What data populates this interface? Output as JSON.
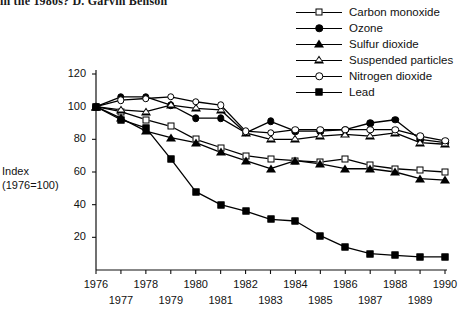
{
  "running_head": "in the 1980s?   D. Garvin Benson",
  "chart_data": {
    "type": "line",
    "title": "",
    "xlabel": "",
    "ylabel": "Index (1976=100)",
    "ylabel_lines": [
      "Index",
      "(1976=100)"
    ],
    "x": [
      1976,
      1977,
      1978,
      1979,
      1980,
      1981,
      1982,
      1983,
      1984,
      1985,
      1986,
      1987,
      1988,
      1989,
      1990
    ],
    "xlim": [
      1976,
      1990
    ],
    "ylim": [
      0,
      120
    ],
    "yticks": [
      0,
      20,
      40,
      60,
      80,
      100,
      120
    ],
    "ytick_labels": [
      "0",
      "20",
      "40",
      "60",
      "80",
      "100",
      "120"
    ],
    "xticks": [
      1976,
      1977,
      1978,
      1979,
      1980,
      1981,
      1982,
      1983,
      1984,
      1985,
      1986,
      1987,
      1988,
      1989,
      1990
    ],
    "xtick_labels_upper": [
      "1976",
      "1978",
      "1980",
      "1982",
      "1984",
      "1986",
      "1988",
      "1990"
    ],
    "xtick_labels_lower": [
      "1977",
      "1979",
      "1981",
      "1983",
      "1985",
      "1987",
      "1989"
    ],
    "grid": false,
    "legend_position": "top-right",
    "series": [
      {
        "name": "Carbon monoxide",
        "marker": "square-open",
        "values": [
          100,
          97,
          92,
          88,
          80,
          75,
          70,
          68,
          67,
          66,
          68,
          64,
          62,
          61,
          60
        ]
      },
      {
        "name": "Ozone",
        "marker": "circle-filled",
        "values": [
          100,
          106,
          106,
          101,
          93,
          93,
          84,
          91,
          85,
          85,
          86,
          90,
          92,
          80,
          78
        ]
      },
      {
        "name": "Sulfur dioxide",
        "marker": "triangle-filled",
        "values": [
          100,
          93,
          85,
          81,
          78,
          72,
          67,
          62,
          67,
          65,
          62,
          62,
          60,
          56,
          55
        ]
      },
      {
        "name": "Suspended particles",
        "marker": "triangle-open",
        "values": [
          100,
          98,
          97,
          101,
          99,
          98,
          84,
          80,
          80,
          82,
          83,
          82,
          84,
          78,
          77
        ]
      },
      {
        "name": "Nitrogen dioxide",
        "marker": "circle-open",
        "values": [
          100,
          104,
          105,
          106,
          103,
          101,
          85,
          84,
          86,
          86,
          86,
          86,
          86,
          82,
          79
        ]
      },
      {
        "name": "Lead",
        "marker": "square-filled",
        "values": [
          100,
          92,
          87,
          68,
          48,
          40,
          36,
          31,
          30,
          21,
          14,
          10,
          9,
          8,
          8
        ]
      }
    ]
  },
  "legend": {
    "items": [
      {
        "label": "Carbon monoxide",
        "marker": "square-open"
      },
      {
        "label": "Ozone",
        "marker": "circle-filled"
      },
      {
        "label": "Sulfur dioxide",
        "marker": "triangle-filled"
      },
      {
        "label": "Suspended particles",
        "marker": "triangle-open"
      },
      {
        "label": "Nitrogen dioxide",
        "marker": "circle-open"
      },
      {
        "label": "Lead",
        "marker": "square-filled"
      }
    ]
  },
  "colors": {
    "ink": "#000000",
    "background": "#ffffff",
    "axis": "#111111"
  }
}
